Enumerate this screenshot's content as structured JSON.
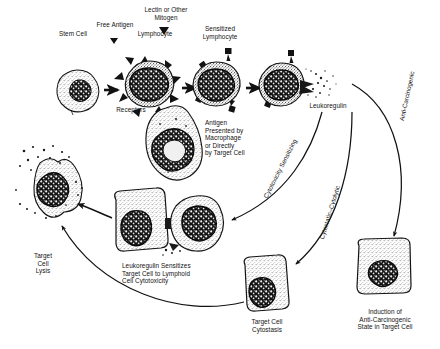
{
  "diagram": {
    "labels": {
      "stem_cell": "Stem Cell",
      "free_antigen": "Free Antigen",
      "lymphocyte": "Lymphocyte",
      "lectin_mitogen": "Lectin or Other\nMitogen",
      "sensitized_lymphocyte": "Sensitized\nLymphocyte",
      "receptors": "Receptors",
      "antigen_presented": "Antigen\nPresented by\nMacrophage\nor Directly\nby Target Cell",
      "leukoregulin": "Leukoregulin",
      "target_cell_lysis": "Target\nCell\nLysis",
      "leukoregulin_sensitizes": "Leukoregulin Sensitizes\nTarget Cell to Lymphoid\nCell Cytotoxicity",
      "target_cell_cytostasis": "Target Cell\nCytostasis",
      "anti_carcinogenic_state": "Induction of\nAnti-Carcinogenic\nState in Target Cell"
    },
    "pathways": [
      {
        "id": "cytotoxicity-sensitizing",
        "label": "Cytotoxicity Sensitizing"
      },
      {
        "id": "cytostatic-cytolytic",
        "label": "Cytostatic–Cytolytic"
      },
      {
        "id": "anti-carcinogenic",
        "label": "Anti-Carcinogenic"
      }
    ],
    "colors": {
      "ink": "#121212",
      "background": "#ffffff",
      "cytoplasm": "#d9d9d9",
      "nucleus": "#1a1a1a"
    }
  }
}
